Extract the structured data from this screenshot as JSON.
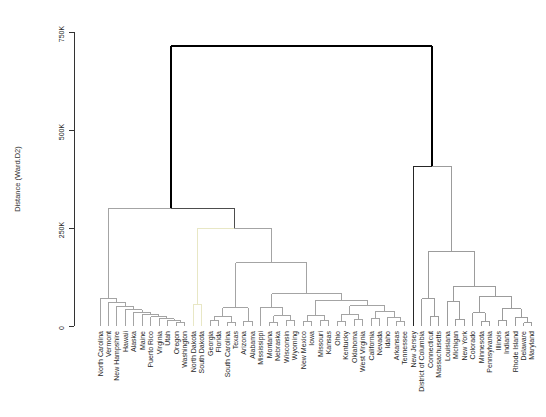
{
  "figure": {
    "width": 546,
    "height": 417,
    "background": "#ffffff"
  },
  "axis": {
    "label": "Distance (Ward.D2)",
    "ticks": [
      {
        "v": 0,
        "label": "0"
      },
      {
        "v": 250,
        "label": "250K"
      },
      {
        "v": 500,
        "label": "500K"
      },
      {
        "v": 750,
        "label": "750K"
      }
    ]
  },
  "colors": {
    "upper_links": "#4d4d4d",
    "root_link": "#000000",
    "cluster_gray": "#a4a4a4",
    "cluster_gray_right": "#9c9c9c",
    "cluster_pale_yellow": "#e8e7c5",
    "singleton_dark": "#262626",
    "labels": "#262626",
    "axis_line": "#333333"
  },
  "chart_data": {
    "type": "dendrogram",
    "title": "",
    "ylabel": "Distance (Ward.D2)",
    "orientation": "leaves-bottom",
    "ylim": [
      0,
      750
    ],
    "height_unit": "thousands (K)",
    "grid": false,
    "leaves": [
      "North Carolina",
      "Vermont",
      "New Hampshire",
      "Hawaii",
      "Alaska",
      "Maine",
      "Puerto Rico",
      "Virginia",
      "Utah",
      "Oregon",
      "Washington",
      "North Dakota",
      "South Dakota",
      "Georgia",
      "Florida",
      "South Carolina",
      "Texas",
      "Arizona",
      "Alabama",
      "Mississippi",
      "Montana",
      "Nebraska",
      "Wisconsin",
      "Wyoming",
      "New Mexico",
      "Iowa",
      "Missouri",
      "Kansas",
      "Ohio",
      "Kentucky",
      "Oklahoma",
      "West Virginia",
      "California",
      "Nevada",
      "Idaho",
      "Arkansas",
      "Tennessee",
      "New Jersey",
      "District of Columbia",
      "Connecticut",
      "Massachusetts",
      "Louisiana",
      "Michigan",
      "New York",
      "Colorado",
      "Minnesota",
      "Pennsylvania",
      "Illinois",
      "Indiana",
      "Rhode Island",
      "Delaware",
      "Maryland"
    ],
    "clusters": [
      {
        "color": "#a4a4a4",
        "members": [
          "North Carolina",
          "Vermont",
          "New Hampshire",
          "Hawaii",
          "Alaska",
          "Maine",
          "Puerto Rico",
          "Virginia",
          "Utah",
          "Oregon",
          "Washington"
        ]
      },
      {
        "color": "#e8e7c5",
        "members": [
          "North Dakota",
          "South Dakota"
        ]
      },
      {
        "color": "#a4a4a4",
        "members": [
          "Georgia",
          "Florida",
          "South Carolina",
          "Texas",
          "Arizona",
          "Alabama",
          "Mississippi",
          "Montana",
          "Nebraska",
          "Wisconsin",
          "Wyoming",
          "New Mexico",
          "Iowa",
          "Missouri",
          "Kansas",
          "Ohio",
          "Kentucky",
          "Oklahoma",
          "West Virginia",
          "California",
          "Nevada",
          "Idaho",
          "Arkansas",
          "Tennessee"
        ]
      },
      {
        "color": "#262626",
        "members": [
          "New Jersey"
        ]
      },
      {
        "color": "#9c9c9c",
        "members": [
          "District of Columbia",
          "Connecticut",
          "Massachusetts",
          "Louisiana",
          "Michigan",
          "New York",
          "Colorado",
          "Minnesota",
          "Pennsylvania",
          "Illinois",
          "Indiana",
          "Rhode Island",
          "Delaware",
          "Maryland"
        ]
      }
    ],
    "tree": {
      "h": 715,
      "lw": 2,
      "ucol": "#000000",
      "c": [
        {
          "h": 300,
          "c": [
            {
              "h": 71,
              "col": "#a4a4a4",
              "c": [
                {
                  "leaf": "North Carolina"
                },
                {
                  "h": 60,
                  "c": [
                    {
                      "leaf": "Vermont"
                    },
                    {
                      "h": 50,
                      "c": [
                        {
                          "leaf": "New Hampshire"
                        },
                        {
                          "h": 42,
                          "c": [
                            {
                              "leaf": "Hawaii"
                            },
                            {
                              "h": 35,
                              "c": [
                                {
                                  "leaf": "Alaska"
                                },
                                {
                                  "h": 29,
                                  "c": [
                                    {
                                      "leaf": "Maine"
                                    },
                                    {
                                      "h": 24,
                                      "c": [
                                        {
                                          "leaf": "Puerto Rico"
                                        },
                                        {
                                          "h": 19,
                                          "c": [
                                            {
                                              "leaf": "Virginia"
                                            },
                                            {
                                              "h": 15,
                                              "c": [
                                                {
                                                  "leaf": "Utah"
                                                },
                                                {
                                                  "h": 10,
                                                  "c": [
                                                    {
                                                      "leaf": "Oregon"
                                                    },
                                                    {
                                                      "leaf": "Washington"
                                                    }
                                                  ]
                                                }
                                              ]
                                            }
                                          ]
                                        }
                                      ]
                                    }
                                  ]
                                }
                              ]
                            }
                          ]
                        }
                      ]
                    }
                  ]
                }
              ]
            },
            {
              "h": 250,
              "c": [
                {
                  "h": 55,
                  "col": "#e8e7c5",
                  "c": [
                    {
                      "leaf": "North Dakota"
                    },
                    {
                      "leaf": "South Dakota"
                    }
                  ]
                },
                {
                  "h": 161,
                  "col": "#a4a4a4",
                  "c": [
                    {
                      "h": 46,
                      "c": [
                        {
                          "h": 25,
                          "c": [
                            {
                              "h": 14,
                              "c": [
                                {
                                  "leaf": "Georgia"
                                },
                                {
                                  "leaf": "Florida"
                                }
                              ]
                            },
                            {
                              "h": 9,
                              "c": [
                                {
                                  "leaf": "South Carolina"
                                },
                                {
                                  "leaf": "Texas"
                                }
                              ]
                            }
                          ]
                        },
                        {
                          "h": 12,
                          "c": [
                            {
                              "leaf": "Arizona"
                            },
                            {
                              "leaf": "Alabama"
                            }
                          ]
                        }
                      ]
                    },
                    {
                      "h": 82,
                      "c": [
                        {
                          "h": 48,
                          "c": [
                            {
                              "leaf": "Mississippi"
                            },
                            {
                              "h": 26,
                              "c": [
                                {
                                  "h": 10,
                                  "c": [
                                    {
                                      "leaf": "Montana"
                                    },
                                    {
                                      "leaf": "Nebraska"
                                    }
                                  ]
                                },
                                {
                                  "h": 13,
                                  "c": [
                                    {
                                      "leaf": "Wisconsin"
                                    },
                                    {
                                      "leaf": "Wyoming"
                                    }
                                  ]
                                }
                              ]
                            }
                          ]
                        },
                        {
                          "h": 66,
                          "c": [
                            {
                              "h": 28,
                              "c": [
                                {
                                  "h": 12,
                                  "c": [
                                    {
                                      "leaf": "New Mexico"
                                    },
                                    {
                                      "leaf": "Iowa"
                                    }
                                  ]
                                },
                                {
                                  "h": 14,
                                  "c": [
                                    {
                                      "leaf": "Missouri"
                                    },
                                    {
                                      "leaf": "Kansas"
                                    }
                                  ]
                                }
                              ]
                            },
                            {
                              "h": 52,
                              "c": [
                                {
                                  "h": 30,
                                  "c": [
                                    {
                                      "h": 11,
                                      "c": [
                                        {
                                          "leaf": "Ohio"
                                        },
                                        {
                                          "leaf": "Kentucky"
                                        }
                                      ]
                                    },
                                    {
                                      "h": 16,
                                      "c": [
                                        {
                                          "leaf": "Oklahoma"
                                        },
                                        {
                                          "leaf": "West Virginia"
                                        }
                                      ]
                                    }
                                  ]
                                },
                                {
                                  "h": 38,
                                  "c": [
                                    {
                                      "h": 18,
                                      "c": [
                                        {
                                          "leaf": "California"
                                        },
                                        {
                                          "leaf": "Nevada"
                                        }
                                      ]
                                    },
                                    {
                                      "h": 22,
                                      "c": [
                                        {
                                          "leaf": "Idaho"
                                        },
                                        {
                                          "h": 12,
                                          "c": [
                                            {
                                              "leaf": "Arkansas"
                                            },
                                            {
                                              "leaf": "Tennessee"
                                            }
                                          ]
                                        }
                                      ]
                                    }
                                  ]
                                }
                              ]
                            }
                          ]
                        }
                      ]
                    }
                  ]
                }
              ]
            }
          ]
        },
        {
          "h": 408,
          "c": [
            {
              "leaf": "New Jersey",
              "col": "#262626"
            },
            {
              "h": 190,
              "col": "#9c9c9c",
              "c": [
                {
                  "h": 70,
                  "c": [
                    {
                      "leaf": "District of Columbia"
                    },
                    {
                      "h": 25,
                      "c": [
                        {
                          "leaf": "Connecticut"
                        },
                        {
                          "leaf": "Massachusetts"
                        }
                      ]
                    }
                  ]
                },
                {
                  "h": 102,
                  "c": [
                    {
                      "h": 63,
                      "c": [
                        {
                          "leaf": "Louisiana"
                        },
                        {
                          "h": 17,
                          "c": [
                            {
                              "leaf": "Michigan"
                            },
                            {
                              "leaf": "New York"
                            }
                          ]
                        }
                      ]
                    },
                    {
                      "h": 74,
                      "c": [
                        {
                          "h": 34,
                          "c": [
                            {
                              "leaf": "Colorado"
                            },
                            {
                              "h": 12,
                              "c": [
                                {
                                  "leaf": "Minnesota"
                                },
                                {
                                  "leaf": "Pennsylvania"
                                }
                              ]
                            }
                          ]
                        },
                        {
                          "h": 44,
                          "c": [
                            {
                              "h": 15,
                              "c": [
                                {
                                  "leaf": "Illinois"
                                },
                                {
                                  "leaf": "Indiana"
                                }
                              ]
                            },
                            {
                              "h": 22,
                              "c": [
                                {
                                  "leaf": "Rhode Island"
                                },
                                {
                                  "h": 8,
                                  "c": [
                                    {
                                      "leaf": "Delaware"
                                    },
                                    {
                                      "leaf": "Maryland"
                                    }
                                  ]
                                }
                              ]
                            }
                          ]
                        }
                      ]
                    }
                  ]
                }
              ]
            }
          ]
        }
      ]
    }
  }
}
